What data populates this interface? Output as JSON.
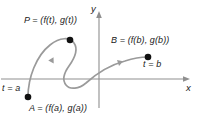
{
  "figure": {
    "type": "parametric-curve-diagram",
    "background_color": "#ffffff",
    "curve_color": "#9a9a9a",
    "axis_color": "#8f8f8f",
    "point_color": "#111111",
    "text_color": "#1a1a1a",
    "axes": {
      "x_label": "x",
      "y_label": "y",
      "x_axis_y_px": 79,
      "y_axis_x_px": 99,
      "x_axis_from_px": 1,
      "x_axis_to_px": 190,
      "y_axis_from_px": 108,
      "y_axis_to_px": 11,
      "arrowheads": [
        "x-positive",
        "y-positive"
      ],
      "grid": false,
      "tick_labels": []
    },
    "points": [
      {
        "id": "P",
        "label": "P = (f(t), g(t))",
        "x_px": 70,
        "y_px": 40,
        "dot_radius_px": 3.2
      },
      {
        "id": "B",
        "label": "B = (f(b), g(b))",
        "param_label": "t = b",
        "x_px": 148,
        "y_px": 57,
        "dot_radius_px": 3.2
      },
      {
        "id": "A",
        "label": "A = (f(a), g(a))",
        "param_label": "t = a",
        "x_px": 28,
        "y_px": 97,
        "dot_radius_px": 3.2
      }
    ],
    "curve": {
      "description": "S-shaped parametric path from A through P, looping below the x-axis, rising to B",
      "path": "M 28 97 C 28 78, 36 56, 50 45 C 60 37, 70 37, 74 43 C 79 50, 74 59, 69 66 C 64 73, 62 80, 66 85 C 70 90, 79 89, 86 83 C 96 74, 110 65, 125 61 C 134 58, 142 57, 148 57",
      "stroke_width_px": 1.6,
      "direction_markers": [
        {
          "x_px": 51,
          "y_px": 62,
          "angle_deg": -62
        },
        {
          "x_px": 118,
          "y_px": 63,
          "angle_deg": -19
        }
      ]
    }
  }
}
